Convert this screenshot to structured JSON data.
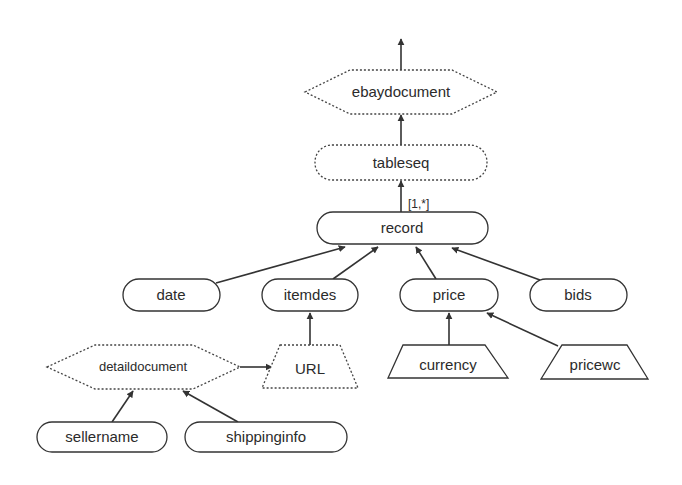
{
  "diagram": {
    "type": "schema-tree",
    "nodes": {
      "ebaydocument": {
        "label": "ebaydocument",
        "shape": "hexagon",
        "style": "dotted"
      },
      "tableseq": {
        "label": "tableseq",
        "shape": "rounded",
        "style": "dotted"
      },
      "record": {
        "label": "record",
        "shape": "rounded",
        "style": "solid"
      },
      "date": {
        "label": "date",
        "shape": "rounded",
        "style": "solid"
      },
      "itemdes": {
        "label": "itemdes",
        "shape": "rounded",
        "style": "solid"
      },
      "price": {
        "label": "price",
        "shape": "rounded",
        "style": "solid"
      },
      "bids": {
        "label": "bids",
        "shape": "rounded",
        "style": "solid"
      },
      "detaildocument": {
        "label": "detaildocument",
        "shape": "hexagon",
        "style": "dotted"
      },
      "url": {
        "label": "URL",
        "shape": "trapezoid",
        "style": "dotted"
      },
      "currency": {
        "label": "currency",
        "shape": "trapezoid",
        "style": "solid"
      },
      "pricewc": {
        "label": "pricewc",
        "shape": "trapezoid",
        "style": "solid"
      },
      "sellername": {
        "label": "sellername",
        "shape": "rounded",
        "style": "solid"
      },
      "shippinginfo": {
        "label": "shippinginfo",
        "shape": "rounded",
        "style": "solid"
      }
    },
    "edges": [
      {
        "from": "ebaydocument",
        "to": "root"
      },
      {
        "from": "tableseq",
        "to": "ebaydocument"
      },
      {
        "from": "record",
        "to": "tableseq",
        "label": "[1,*]"
      },
      {
        "from": "date",
        "to": "record"
      },
      {
        "from": "itemdes",
        "to": "record"
      },
      {
        "from": "price",
        "to": "record"
      },
      {
        "from": "bids",
        "to": "record"
      },
      {
        "from": "url",
        "to": "itemdes"
      },
      {
        "from": "detaildocument",
        "to": "url"
      },
      {
        "from": "currency",
        "to": "price"
      },
      {
        "from": "pricewc",
        "to": "price"
      },
      {
        "from": "sellername",
        "to": "detaildocument"
      },
      {
        "from": "shippinginfo",
        "to": "detaildocument"
      }
    ],
    "cardinality_label": "[1,*]"
  }
}
